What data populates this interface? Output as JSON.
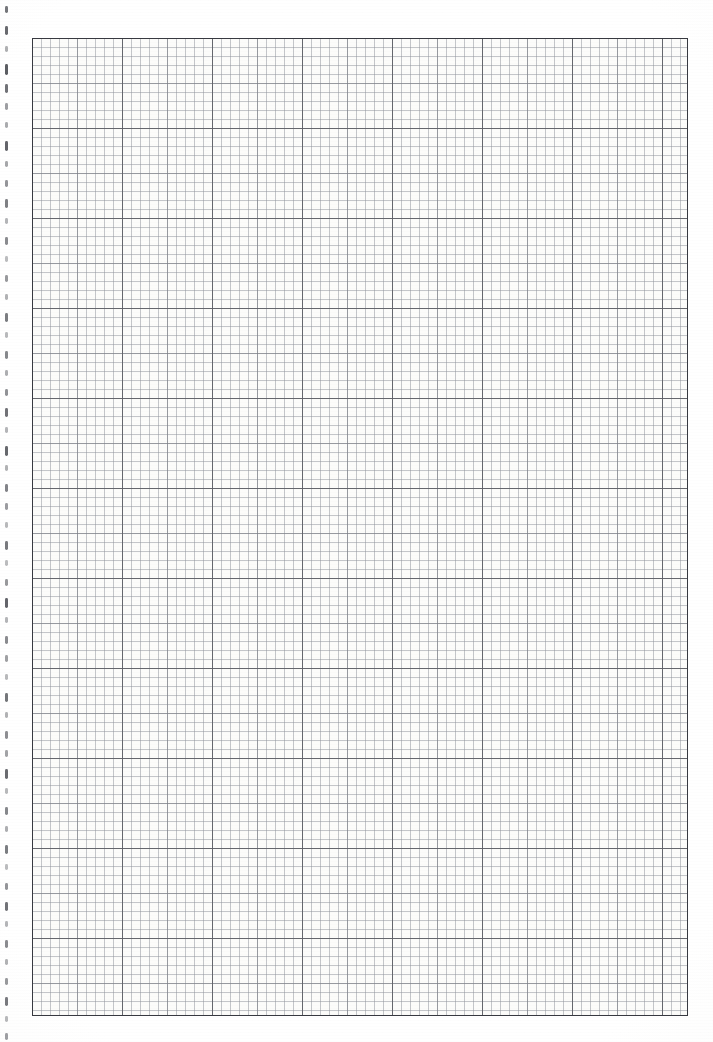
{
  "document": {
    "kind": "graph-paper-scan",
    "page_width": 713,
    "page_height": 1042,
    "background_color": "#ffffff"
  },
  "grid": {
    "label": "",
    "origin_x": 32,
    "origin_y": 38,
    "width": 656,
    "height": 978,
    "minor_cell_px": 9,
    "medium_cell_px": 45,
    "major_cell_px": 90,
    "minor_line_color": "#7a7e88",
    "medium_line_color": "#60636c",
    "major_line_color": "#3c3e46",
    "frame_color": "#373940",
    "paper_color": "#fdfdfb"
  },
  "binding": {
    "label": "",
    "mark_color": "#4d4f55",
    "mark_x": 5,
    "mark_width": 2.6,
    "marks": [
      {
        "y": 6,
        "h": 7,
        "o": 0.78
      },
      {
        "y": 26,
        "h": 9,
        "o": 0.85
      },
      {
        "y": 46,
        "h": 6,
        "o": 0.45
      },
      {
        "y": 64,
        "h": 11,
        "o": 0.92
      },
      {
        "y": 84,
        "h": 9,
        "o": 0.8
      },
      {
        "y": 103,
        "h": 7,
        "o": 0.55
      },
      {
        "y": 122,
        "h": 6,
        "o": 0.48
      },
      {
        "y": 141,
        "h": 10,
        "o": 0.88
      },
      {
        "y": 161,
        "h": 6,
        "o": 0.5
      },
      {
        "y": 180,
        "h": 7,
        "o": 0.6
      },
      {
        "y": 199,
        "h": 9,
        "o": 0.72
      },
      {
        "y": 218,
        "h": 6,
        "o": 0.42
      },
      {
        "y": 237,
        "h": 8,
        "o": 0.66
      },
      {
        "y": 256,
        "h": 6,
        "o": 0.38
      },
      {
        "y": 275,
        "h": 7,
        "o": 0.58
      },
      {
        "y": 294,
        "h": 6,
        "o": 0.44
      },
      {
        "y": 313,
        "h": 9,
        "o": 0.74
      },
      {
        "y": 332,
        "h": 6,
        "o": 0.4
      },
      {
        "y": 351,
        "h": 8,
        "o": 0.68
      },
      {
        "y": 370,
        "h": 6,
        "o": 0.46
      },
      {
        "y": 389,
        "h": 7,
        "o": 0.62
      },
      {
        "y": 408,
        "h": 9,
        "o": 0.8
      },
      {
        "y": 427,
        "h": 6,
        "o": 0.42
      },
      {
        "y": 446,
        "h": 10,
        "o": 0.86
      },
      {
        "y": 465,
        "h": 6,
        "o": 0.44
      },
      {
        "y": 484,
        "h": 8,
        "o": 0.7
      },
      {
        "y": 503,
        "h": 7,
        "o": 0.56
      },
      {
        "y": 522,
        "h": 6,
        "o": 0.4
      },
      {
        "y": 541,
        "h": 9,
        "o": 0.76
      },
      {
        "y": 560,
        "h": 6,
        "o": 0.38
      },
      {
        "y": 579,
        "h": 7,
        "o": 0.58
      },
      {
        "y": 598,
        "h": 10,
        "o": 0.88
      },
      {
        "y": 617,
        "h": 6,
        "o": 0.42
      },
      {
        "y": 636,
        "h": 8,
        "o": 0.66
      },
      {
        "y": 655,
        "h": 7,
        "o": 0.54
      },
      {
        "y": 674,
        "h": 6,
        "o": 0.4
      },
      {
        "y": 693,
        "h": 9,
        "o": 0.78
      },
      {
        "y": 712,
        "h": 6,
        "o": 0.44
      },
      {
        "y": 731,
        "h": 8,
        "o": 0.64
      },
      {
        "y": 750,
        "h": 7,
        "o": 0.52
      },
      {
        "y": 769,
        "h": 10,
        "o": 0.84
      },
      {
        "y": 788,
        "h": 6,
        "o": 0.4
      },
      {
        "y": 807,
        "h": 8,
        "o": 0.68
      },
      {
        "y": 826,
        "h": 6,
        "o": 0.46
      },
      {
        "y": 845,
        "h": 9,
        "o": 0.74
      },
      {
        "y": 864,
        "h": 6,
        "o": 0.38
      },
      {
        "y": 883,
        "h": 7,
        "o": 0.6
      },
      {
        "y": 902,
        "h": 9,
        "o": 0.8
      },
      {
        "y": 921,
        "h": 6,
        "o": 0.42
      },
      {
        "y": 940,
        "h": 8,
        "o": 0.66
      },
      {
        "y": 959,
        "h": 6,
        "o": 0.44
      },
      {
        "y": 978,
        "h": 7,
        "o": 0.58
      },
      {
        "y": 997,
        "h": 9,
        "o": 0.76
      },
      {
        "y": 1016,
        "h": 6,
        "o": 0.4
      },
      {
        "y": 1033,
        "h": 7,
        "o": 0.55
      }
    ]
  }
}
